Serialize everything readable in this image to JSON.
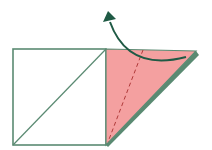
{
  "diagram": {
    "type": "origami-fold-step",
    "colors": {
      "paper_white": "#ffffff",
      "paper_color": "#f4a0a0",
      "edge": "#5a8a72",
      "arrow": "#1f5a45",
      "fold_line": "#b03a3a"
    },
    "elements": {
      "square": {
        "x": 13,
        "y": 49,
        "w": 93,
        "h": 96
      },
      "diagonal": {
        "x1": 13,
        "y1": 145,
        "x2": 106,
        "y2": 49
      },
      "flap": {
        "points": "106,49 196,51 106,145"
      },
      "flap_shadow": {
        "points": "106,145 196,51 198,55 108,146"
      },
      "valley_fold_line": {
        "x1": 143,
        "y1": 49,
        "x2": 108,
        "y2": 142
      },
      "arrow_path": "M 186 57 Q 130 75 110 20",
      "arrow_head": "103,20 108,11 116,18"
    },
    "labels": {
      "description": "Fold the colored flap back along the dashed valley line"
    }
  }
}
